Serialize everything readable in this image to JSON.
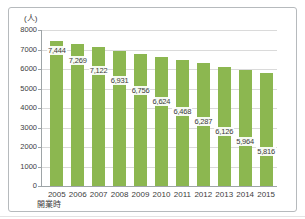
{
  "chart_data": {
    "type": "bar",
    "title": "",
    "unit_label": "(人)",
    "x_note": "開業時",
    "categories": [
      "2005",
      "2006",
      "2007",
      "2008",
      "2009",
      "2010",
      "2011",
      "2012",
      "2013",
      "2014",
      "2015"
    ],
    "values": [
      7444,
      7269,
      7122,
      6931,
      6756,
      6624,
      6468,
      6287,
      6126,
      5964,
      5816
    ],
    "value_labels": [
      "7,444",
      "7,269",
      "7,122",
      "6,931",
      "6,756",
      "6,624",
      "6,468",
      "6,287",
      "6,126",
      "5,964",
      "5,816"
    ],
    "xlabel": "",
    "ylabel": "",
    "ylim": [
      0,
      8000
    ],
    "ytick_step": 1000,
    "ytick_labels": [
      "8000",
      "7000",
      "6000",
      "5000",
      "4000",
      "3000",
      "2000",
      "1000",
      "0"
    ],
    "grid": "horizontal",
    "legend": "none",
    "colors": {
      "bar": "#8CB750",
      "gridline": "#DADADA",
      "axis": "#9EA4A7",
      "text": "#3D3D3D",
      "frame_border": "#B6BABD"
    }
  }
}
